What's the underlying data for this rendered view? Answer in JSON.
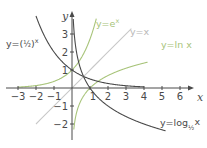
{
  "chart_data": {
    "type": "line",
    "title": "",
    "xlabel": "x",
    "ylabel": "y",
    "xlim": [
      -3,
      6.5
    ],
    "ylim": [
      -2.3,
      4
    ],
    "grid": false,
    "legend_position": "inline labels",
    "x_ticks": [
      -3,
      -2,
      -1,
      1,
      2,
      3,
      4,
      5,
      6
    ],
    "y_ticks": [
      -2,
      -1,
      1,
      2,
      3
    ],
    "x_tick_labels": [
      "−3",
      "−2",
      "−1",
      "1",
      "2",
      "3",
      "4",
      "5",
      "6"
    ],
    "y_tick_labels": [
      "−2",
      "−1",
      "1",
      "2",
      "3"
    ],
    "series": [
      {
        "name": "y=eˣ",
        "function": "exp(x)",
        "color": "#a8c47a",
        "label_text": "y=eˣ"
      },
      {
        "name": "y=x",
        "function": "x",
        "color": "#c8c8c8",
        "label_text": "y=x"
      },
      {
        "name": "y=ln x",
        "function": "ln(x)",
        "color": "#a8c47a",
        "label_text": "y=ln x"
      },
      {
        "name": "y=(1/2)ˣ",
        "function": "0.5^x",
        "color": "#4a4a4a",
        "label_text": "y=(½)ˣ"
      },
      {
        "name": "y=log_(1/2) x",
        "function": "log_0.5(x)",
        "color": "#4a4a4a",
        "label_text": "y=log½ x"
      }
    ],
    "key_points": [
      {
        "x": 0,
        "y": 1,
        "note": "intersection of y=eˣ and y=(½)ˣ"
      },
      {
        "x": 1,
        "y": 0,
        "note": "intersection of y=ln x and y=log½ x"
      }
    ]
  },
  "axes": {
    "x_name": "x",
    "y_name": "y"
  },
  "labels": {
    "exp": "y=e",
    "exp_sup": "x",
    "identity": "y=x",
    "ln": "y=ln x",
    "half_pow_prefix": "y=(",
    "half_pow_frac": "½",
    "half_pow_suffix": ")",
    "half_pow_sup": "x",
    "log_half_prefix": "y=log",
    "log_half_sub": "½",
    "log_half_arg": "x"
  },
  "colors": {
    "axis": "#4a4a4a",
    "green": "#a8c47a",
    "gray_line": "#c8c8c8",
    "dark": "#4a4a4a"
  }
}
